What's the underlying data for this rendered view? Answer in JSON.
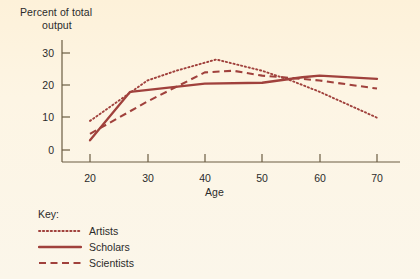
{
  "chart_data": {
    "type": "line",
    "title": "",
    "ylabel": "Percent of total output",
    "ylabel_line1": "Percent of total",
    "ylabel_line2": "output",
    "xlabel": "Age",
    "x": [
      20,
      30,
      40,
      50,
      60,
      70
    ],
    "xlim": [
      17,
      73
    ],
    "ylim": [
      -3,
      32
    ],
    "xticks": [
      "20",
      "30",
      "40",
      "50",
      "60",
      "70"
    ],
    "yticks": [
      "0",
      "10",
      "20",
      "30"
    ],
    "ytick_values": [
      0,
      10,
      20,
      30
    ],
    "grid": false,
    "legend_position": "below-left",
    "legend_title": "Key:",
    "series": [
      {
        "name": "Artists",
        "style": "dotted",
        "color": "#a0413c",
        "points": [
          {
            "age": 20,
            "value": 9.0
          },
          {
            "age": 30,
            "value": 21.5
          },
          {
            "age": 35,
            "value": 24.5
          },
          {
            "age": 42,
            "value": 28.0
          },
          {
            "age": 50,
            "value": 24.5
          },
          {
            "age": 55,
            "value": 21.5
          },
          {
            "age": 60,
            "value": 18.0
          },
          {
            "age": 70,
            "value": 10.0
          }
        ]
      },
      {
        "name": "Scholars",
        "style": "solid",
        "color": "#a0413c",
        "points": [
          {
            "age": 20,
            "value": 3.0
          },
          {
            "age": 27,
            "value": 18.0
          },
          {
            "age": 40,
            "value": 20.5
          },
          {
            "age": 50,
            "value": 20.8
          },
          {
            "age": 57,
            "value": 22.5
          },
          {
            "age": 60,
            "value": 23.0
          },
          {
            "age": 70,
            "value": 22.0
          }
        ]
      },
      {
        "name": "Scientists",
        "style": "dashed",
        "color": "#a0413c",
        "points": [
          {
            "age": 20,
            "value": 5.0
          },
          {
            "age": 30,
            "value": 15.0
          },
          {
            "age": 40,
            "value": 24.0
          },
          {
            "age": 45,
            "value": 24.5
          },
          {
            "age": 50,
            "value": 23.0
          },
          {
            "age": 57,
            "value": 22.0
          },
          {
            "age": 60,
            "value": 21.5
          },
          {
            "age": 70,
            "value": 19.0
          }
        ]
      }
    ]
  },
  "legend": {
    "title": "Key:",
    "entries": [
      {
        "label": "Artists",
        "style": "dotted"
      },
      {
        "label": "Scholars",
        "style": "solid"
      },
      {
        "label": "Scientists",
        "style": "dashed"
      }
    ]
  },
  "colors": {
    "background": "#fdf3e0",
    "line": "#a0413c",
    "axis": "#6b5d42",
    "text": "#2b2b2b"
  }
}
